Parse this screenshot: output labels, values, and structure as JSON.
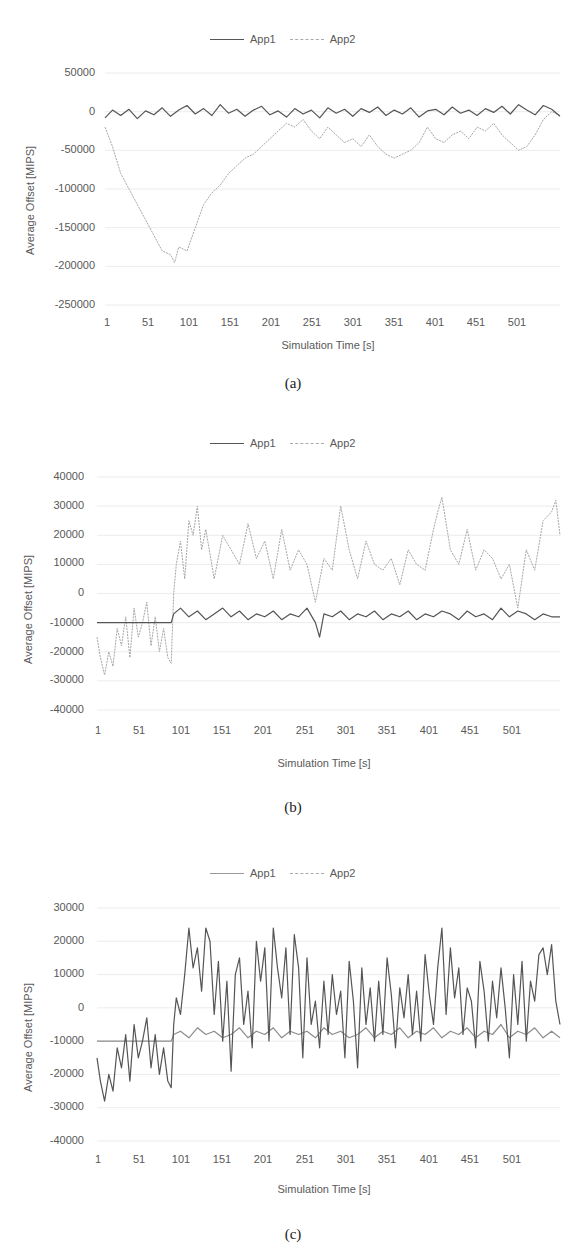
{
  "chart_data": [
    {
      "id": "a",
      "type": "line",
      "caption": "(a)",
      "title": "",
      "xlabel": "Simulation Time [s]",
      "ylabel": "Average Offset [MIPS]",
      "legend": [
        "App1",
        "App2"
      ],
      "legend_position": "top",
      "grid": true,
      "ylim": [
        -250000,
        50000
      ],
      "yticks": [
        50000,
        0,
        -50000,
        -100000,
        -150000,
        -200000,
        -250000
      ],
      "xticks": [
        1,
        51,
        101,
        151,
        201,
        251,
        301,
        351,
        401,
        451,
        501
      ],
      "xlim": [
        1,
        550
      ],
      "series": [
        {
          "name": "App1",
          "style": "solid",
          "color": "#555555",
          "x": [
            1,
            10,
            20,
            30,
            40,
            50,
            60,
            70,
            80,
            90,
            100,
            110,
            120,
            130,
            140,
            150,
            160,
            170,
            180,
            190,
            200,
            210,
            220,
            230,
            240,
            250,
            260,
            270,
            280,
            290,
            300,
            310,
            320,
            330,
            340,
            350,
            360,
            370,
            380,
            390,
            400,
            410,
            420,
            430,
            440,
            450,
            460,
            470,
            480,
            490,
            500,
            510,
            520,
            530,
            540,
            550
          ],
          "values": [
            -8000,
            2000,
            -5000,
            3000,
            -9000,
            1000,
            -4000,
            5000,
            -6000,
            2000,
            8000,
            -3000,
            4000,
            -5000,
            9000,
            -2000,
            3000,
            -6000,
            2000,
            7000,
            -4000,
            1000,
            -7000,
            4000,
            -3000,
            2000,
            -8000,
            5000,
            -2000,
            3000,
            -6000,
            4000,
            -1000,
            6000,
            -5000,
            2000,
            -3000,
            5000,
            -7000,
            1000,
            3000,
            -4000,
            6000,
            -2000,
            2000,
            -5000,
            4000,
            -1000,
            7000,
            -3000,
            9000,
            2000,
            -4000,
            8000,
            3000,
            -6000
          ]
        },
        {
          "name": "App2",
          "style": "dashed",
          "color": "#a6a6a6",
          "x": [
            1,
            10,
            20,
            30,
            40,
            50,
            60,
            70,
            80,
            85,
            90,
            100,
            110,
            120,
            130,
            140,
            150,
            160,
            170,
            180,
            190,
            200,
            210,
            220,
            230,
            240,
            250,
            260,
            270,
            280,
            290,
            300,
            310,
            320,
            330,
            340,
            350,
            360,
            370,
            380,
            390,
            400,
            410,
            420,
            430,
            440,
            450,
            460,
            470,
            480,
            490,
            500,
            510,
            520,
            530,
            540,
            550
          ],
          "values": [
            -20000,
            -45000,
            -80000,
            -100000,
            -120000,
            -140000,
            -160000,
            -180000,
            -185000,
            -195000,
            -175000,
            -180000,
            -150000,
            -120000,
            -105000,
            -95000,
            -80000,
            -70000,
            -60000,
            -55000,
            -45000,
            -35000,
            -25000,
            -15000,
            -20000,
            -10000,
            -25000,
            -35000,
            -20000,
            -30000,
            -40000,
            -35000,
            -45000,
            -30000,
            -45000,
            -55000,
            -60000,
            -55000,
            -50000,
            -40000,
            -20000,
            -35000,
            -40000,
            -30000,
            -25000,
            -35000,
            -20000,
            -25000,
            -15000,
            -30000,
            -40000,
            -50000,
            -45000,
            -30000,
            -10000,
            0,
            -5000
          ]
        }
      ]
    },
    {
      "id": "b",
      "type": "line",
      "caption": "(b)",
      "title": "",
      "xlabel": "Simulation Time [s]",
      "ylabel": "Average Offset [MIPS]",
      "legend": [
        "App1",
        "App2"
      ],
      "legend_position": "top",
      "grid": true,
      "ylim": [
        -40000,
        40000
      ],
      "yticks": [
        40000,
        30000,
        20000,
        10000,
        0,
        -10000,
        -20000,
        -30000,
        -40000
      ],
      "xticks": [
        1,
        51,
        101,
        151,
        201,
        251,
        301,
        351,
        401,
        451,
        501
      ],
      "xlim": [
        1,
        550
      ],
      "series": [
        {
          "name": "App1",
          "style": "solid",
          "color": "#555555",
          "x": [
            1,
            10,
            20,
            30,
            40,
            50,
            60,
            70,
            80,
            89,
            92,
            100,
            110,
            120,
            130,
            140,
            150,
            160,
            170,
            180,
            190,
            200,
            210,
            220,
            230,
            240,
            250,
            260,
            265,
            270,
            280,
            290,
            300,
            310,
            320,
            330,
            340,
            350,
            360,
            370,
            380,
            390,
            400,
            410,
            420,
            430,
            440,
            450,
            460,
            470,
            480,
            490,
            500,
            510,
            520,
            530,
            540,
            550
          ],
          "values": [
            -10000,
            -10000,
            -10000,
            -10000,
            -10000,
            -10000,
            -10000,
            -10000,
            -10000,
            -10000,
            -7000,
            -5000,
            -8000,
            -6000,
            -9000,
            -7000,
            -5000,
            -8000,
            -6000,
            -9000,
            -7000,
            -8000,
            -6000,
            -9000,
            -7000,
            -8000,
            -5000,
            -10000,
            -15000,
            -7000,
            -8000,
            -6000,
            -9000,
            -7000,
            -8000,
            -6000,
            -9000,
            -7000,
            -8000,
            -6000,
            -9000,
            -7000,
            -8000,
            -6000,
            -7000,
            -9000,
            -6000,
            -8000,
            -7000,
            -9000,
            -5000,
            -8000,
            -6000,
            -7000,
            -9000,
            -7000,
            -8000,
            -8000
          ]
        },
        {
          "name": "App2",
          "style": "dashed",
          "color": "#a6a6a6",
          "x": [
            1,
            5,
            10,
            15,
            20,
            25,
            30,
            35,
            40,
            45,
            50,
            55,
            60,
            65,
            70,
            75,
            80,
            85,
            89,
            92,
            95,
            100,
            105,
            110,
            115,
            120,
            125,
            130,
            140,
            150,
            160,
            170,
            180,
            190,
            200,
            210,
            220,
            230,
            240,
            250,
            260,
            270,
            280,
            290,
            300,
            310,
            320,
            330,
            340,
            350,
            360,
            370,
            380,
            390,
            400,
            405,
            410,
            420,
            430,
            440,
            450,
            460,
            470,
            480,
            490,
            500,
            510,
            520,
            530,
            540,
            545,
            550
          ],
          "values": [
            -15000,
            -22000,
            -28000,
            -20000,
            -25000,
            -12000,
            -18000,
            -8000,
            -22000,
            -5000,
            -15000,
            -10000,
            -3000,
            -18000,
            -8000,
            -20000,
            -12000,
            -22000,
            -24000,
            0,
            10000,
            18000,
            5000,
            25000,
            20000,
            30000,
            15000,
            22000,
            5000,
            20000,
            15000,
            10000,
            24000,
            12000,
            18000,
            5000,
            22000,
            8000,
            15000,
            10000,
            -3000,
            12000,
            8000,
            30000,
            15000,
            5000,
            18000,
            10000,
            8000,
            12000,
            3000,
            15000,
            10000,
            8000,
            22000,
            28000,
            33000,
            15000,
            10000,
            22000,
            8000,
            15000,
            12000,
            5000,
            10000,
            -5000,
            15000,
            8000,
            25000,
            28000,
            32000,
            20000
          ]
        }
      ]
    },
    {
      "id": "c",
      "type": "line",
      "caption": "(c)",
      "title": "",
      "xlabel": "Simulation Time [s]",
      "ylabel": "Average Offset [MIPS]",
      "legend": [
        "App1",
        "App2"
      ],
      "legend_position": "top",
      "grid": true,
      "ylim": [
        -40000,
        30000
      ],
      "yticks": [
        30000,
        20000,
        10000,
        0,
        -10000,
        -20000,
        -30000,
        -40000
      ],
      "xticks": [
        1,
        51,
        101,
        151,
        201,
        251,
        301,
        351,
        401,
        451,
        501
      ],
      "xlim": [
        1,
        550
      ],
      "series": [
        {
          "name": "App1",
          "style": "solid",
          "color": "#8c8c8c",
          "x": [
            1,
            10,
            20,
            30,
            40,
            50,
            60,
            70,
            80,
            89,
            92,
            100,
            110,
            120,
            130,
            140,
            150,
            160,
            170,
            180,
            190,
            200,
            210,
            220,
            230,
            240,
            250,
            260,
            270,
            280,
            290,
            300,
            310,
            320,
            330,
            340,
            350,
            360,
            370,
            380,
            390,
            400,
            410,
            420,
            430,
            440,
            450,
            460,
            470,
            480,
            490,
            500,
            510,
            520,
            530,
            540,
            550
          ],
          "values": [
            -10000,
            -10000,
            -10000,
            -10000,
            -10000,
            -10000,
            -10000,
            -10000,
            -10000,
            -10000,
            -8000,
            -7000,
            -9000,
            -6000,
            -8000,
            -7000,
            -9000,
            -8000,
            -6000,
            -9000,
            -7000,
            -8000,
            -6000,
            -9000,
            -7000,
            -8000,
            -7000,
            -9000,
            -6000,
            -8000,
            -7000,
            -9000,
            -8000,
            -6000,
            -9000,
            -7000,
            -8000,
            -6000,
            -9000,
            -7000,
            -8000,
            -6000,
            -9000,
            -7000,
            -8000,
            -6000,
            -9000,
            -7000,
            -8000,
            -5000,
            -9000,
            -7000,
            -8000,
            -6000,
            -9000,
            -7000,
            -9000
          ]
        },
        {
          "name": "App2",
          "style": "solid",
          "color": "#555555",
          "x": [
            1,
            5,
            10,
            15,
            20,
            25,
            30,
            35,
            40,
            45,
            50,
            55,
            60,
            65,
            70,
            75,
            80,
            85,
            89,
            92,
            95,
            100,
            105,
            110,
            115,
            120,
            125,
            130,
            135,
            140,
            145,
            150,
            155,
            160,
            165,
            170,
            175,
            180,
            185,
            190,
            195,
            200,
            205,
            210,
            215,
            220,
            225,
            230,
            235,
            240,
            245,
            250,
            255,
            260,
            265,
            270,
            275,
            280,
            285,
            290,
            295,
            300,
            305,
            310,
            315,
            320,
            325,
            330,
            335,
            340,
            345,
            350,
            355,
            360,
            365,
            370,
            375,
            380,
            385,
            390,
            395,
            400,
            405,
            410,
            415,
            420,
            425,
            430,
            435,
            440,
            445,
            450,
            455,
            460,
            465,
            470,
            475,
            480,
            485,
            490,
            495,
            500,
            505,
            510,
            515,
            520,
            525,
            530,
            535,
            540,
            545,
            550
          ],
          "values": [
            -15000,
            -22000,
            -28000,
            -20000,
            -25000,
            -12000,
            -18000,
            -8000,
            -22000,
            -5000,
            -15000,
            -10000,
            -3000,
            -18000,
            -8000,
            -20000,
            -12000,
            -22000,
            -24000,
            -5000,
            3000,
            -2000,
            10000,
            24000,
            12000,
            18000,
            5000,
            24000,
            20000,
            -2000,
            14000,
            -10000,
            8000,
            -19000,
            10000,
            15000,
            -5000,
            5000,
            -12000,
            20000,
            8000,
            18000,
            -10000,
            24000,
            12000,
            3000,
            18000,
            -8000,
            22000,
            12000,
            -15000,
            15000,
            -5000,
            2000,
            -12000,
            8000,
            -8000,
            10000,
            -2000,
            5000,
            -15000,
            14000,
            2000,
            -18000,
            12000,
            -5000,
            6000,
            -10000,
            8000,
            -8000,
            15000,
            4000,
            -12000,
            6000,
            -3000,
            10000,
            -8000,
            5000,
            -10000,
            16000,
            4000,
            -5000,
            12000,
            24000,
            -2000,
            18000,
            3000,
            12000,
            -8000,
            6000,
            2000,
            -12000,
            14000,
            5000,
            -10000,
            8000,
            -3000,
            12000,
            0,
            -15000,
            10000,
            -5000,
            14000,
            -10000,
            8000,
            2000,
            16000,
            18000,
            10000,
            19000,
            2000,
            -5000
          ]
        }
      ]
    }
  ],
  "figures": [
    {
      "legend": {
        "app1": "App1",
        "app2": "App2"
      },
      "xlabel": "Simulation Time [s]",
      "ylabel": "Average Offset [MIPS]",
      "caption": "(a)",
      "yticks": [
        "50000",
        "0",
        "-50000",
        "-100000",
        "-150000",
        "-200000",
        "-250000"
      ],
      "xticks": [
        "1",
        "51",
        "101",
        "151",
        "201",
        "251",
        "301",
        "351",
        "401",
        "451",
        "501"
      ]
    },
    {
      "legend": {
        "app1": "App1",
        "app2": "App2"
      },
      "xlabel": "Simulation Time [s]",
      "ylabel": "Average Offset [MIPS]",
      "caption": "(b)",
      "yticks": [
        "40000",
        "30000",
        "20000",
        "10000",
        "0",
        "-10000",
        "-20000",
        "-30000",
        "-40000"
      ],
      "xticks": [
        "1",
        "51",
        "101",
        "151",
        "201",
        "251",
        "301",
        "351",
        "401",
        "451",
        "501"
      ]
    },
    {
      "legend": {
        "app1": "App1",
        "app2": "App2"
      },
      "xlabel": "Simulation Time [s]",
      "ylabel": "Average Offset [MIPS]",
      "caption": "(c)",
      "yticks": [
        "30000",
        "20000",
        "10000",
        "0",
        "-10000",
        "-20000",
        "-30000",
        "-40000"
      ],
      "xticks": [
        "1",
        "51",
        "101",
        "151",
        "201",
        "251",
        "301",
        "351",
        "401",
        "451",
        "501"
      ]
    }
  ]
}
